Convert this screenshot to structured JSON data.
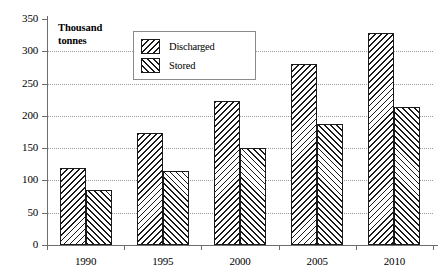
{
  "chart_data": {
    "type": "bar",
    "title": "",
    "subtitle": "",
    "xlabel": "",
    "ylabel": "Thousand\ntonnes",
    "categories": [
      "1990",
      "1995",
      "2000",
      "2005",
      "2010"
    ],
    "series": [
      {
        "name": "Discharged",
        "values": [
          120,
          173,
          223,
          280,
          328
        ],
        "pattern": "backward-hatch",
        "color": "#1a1a1a"
      },
      {
        "name": "Stored",
        "values": [
          85,
          115,
          150,
          188,
          213
        ],
        "pattern": "forward-hatch",
        "color": "#1a1a1a"
      }
    ],
    "ylim": [
      0,
      350
    ],
    "yticks": [
      0,
      50,
      100,
      150,
      200,
      250,
      300,
      350
    ],
    "ytick_labels": [
      "0",
      "50",
      "100",
      "150",
      "200",
      "250",
      "300",
      "350"
    ],
    "grid": true,
    "grid_axis": "y",
    "grid_style": "dotted",
    "grid_color": "#9a9a9a",
    "legend_position": "upper-left-inside",
    "legend_entries": [
      "Discharged",
      "Stored"
    ],
    "background_color": "#ffffff",
    "axis_color": "#6e6e6e"
  }
}
